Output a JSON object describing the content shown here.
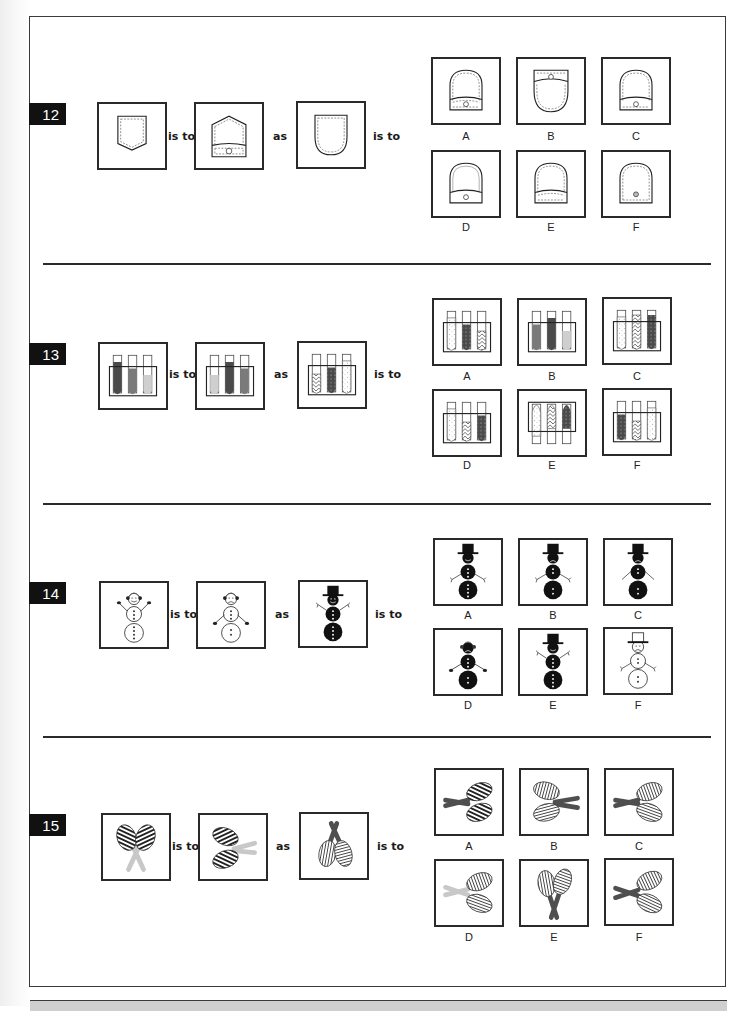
{
  "worksheet": {
    "connector_is_to": "is to",
    "connector_as": "as",
    "questions": [
      {
        "number": "12",
        "topic": "pockets",
        "prompt": [
          "pocket-pointed",
          "pocket-pointed-with-flap-button",
          "pocket-rounded"
        ],
        "options": [
          {
            "label": "A",
            "description": "rounded pocket with bottom band and button"
          },
          {
            "label": "B",
            "description": "rounded pocket with top flap and button"
          },
          {
            "label": "C",
            "description": "rounded pocket with bottom band and button"
          },
          {
            "label": "D",
            "description": "rounded pocket, solid inner line, bottom band and button"
          },
          {
            "label": "E",
            "description": "rounded pocket with bottom band, no button"
          },
          {
            "label": "F",
            "description": "rounded pocket with button, no band"
          }
        ]
      },
      {
        "number": "13",
        "topic": "test-tubes",
        "prompt": [
          "tubes dark-medium-light",
          "tubes light-dark-medium",
          "tubes zigzag-dots-speckled"
        ],
        "options": [
          {
            "label": "A",
            "description": "speckled, dark dotted, zigzag"
          },
          {
            "label": "B",
            "description": "medium, dark, light solid"
          },
          {
            "label": "C",
            "description": "speckled, zigzag, dark dotted"
          },
          {
            "label": "D",
            "description": "speckled, zigzag, dark dotted (varying levels)"
          },
          {
            "label": "E",
            "description": "rack raised: speckled, zigzag, dark dotted"
          },
          {
            "label": "F",
            "description": "dark dotted, zigzag, speckled"
          }
        ]
      },
      {
        "number": "14",
        "topic": "snowmen",
        "prompt": [
          "white snowman happy earmuffs arms up",
          "white snowman sad earmuffs arms down",
          "black snowman top hat happy arms up"
        ],
        "options": [
          {
            "label": "A",
            "description": "black snowman top hat, happy, arms down"
          },
          {
            "label": "B",
            "description": "black snowman top hat, sad, arms down"
          },
          {
            "label": "C",
            "description": "black snowman top hat, sad, plain arms"
          },
          {
            "label": "D",
            "description": "black snowman earmuffs, sad, mittens"
          },
          {
            "label": "E",
            "description": "black snowman top hat, happy, arms up"
          },
          {
            "label": "F",
            "description": "white snowman outlined top hat, sad"
          }
        ]
      },
      {
        "number": "15",
        "topic": "drumsticks",
        "prompt": [
          "diagonal-striped pair, light bone down",
          "diagonal-striped pair rotated, light bone right",
          "vertical/horizontal striped pair, dark bone up"
        ],
        "options": [
          {
            "label": "A",
            "description": "dark bone left, diagonal stripes"
          },
          {
            "label": "B",
            "description": "dark bone right, vertical/horizontal stripes"
          },
          {
            "label": "C",
            "description": "dark bone left, vertical/horizontal stripes"
          },
          {
            "label": "D",
            "description": "light bone left, vertical/horizontal stripes"
          },
          {
            "label": "E",
            "description": "dark bone down, vertical/horizontal stripes"
          },
          {
            "label": "F",
            "description": "dark bone left, vertical/horizontal stripes (variant)"
          }
        ]
      }
    ]
  },
  "colors": {
    "badge_bg": "#111111",
    "border": "#2a2a2a",
    "tube_dark": "#4a4a4a",
    "tube_medium": "#7a7a7a",
    "tube_light": "#cfcfcf",
    "bone_dark": "#4f4f4f",
    "bone_light": "#c8c8c8",
    "bottom_bar": "#cfcfcf"
  }
}
